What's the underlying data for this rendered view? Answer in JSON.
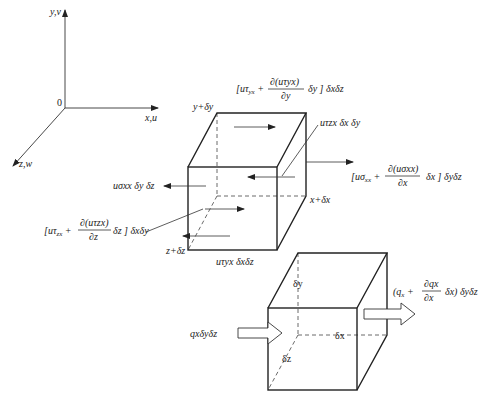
{
  "axes": {
    "y_label": "y,v",
    "x_label": "x,u",
    "z_label": "z,w",
    "origin_label": "0"
  },
  "stress_cube": {
    "top_label": "y+δy",
    "right_label": "x+δx",
    "front_label": "z+δz",
    "top_term": {
      "prefix": "[uτ",
      "sub": "yx",
      "plus": " + ",
      "num": "∂(uτyx)",
      "den": "∂y",
      "suffix": "δy ] δxδz"
    },
    "right_term": {
      "prefix": "[uσ",
      "sub": "xx",
      "plus": " + ",
      "num": "∂(uσxx)",
      "den": "∂x",
      "suffix": "δx ] δyδz"
    },
    "front_term": {
      "prefix": "[uτ",
      "sub": "zx",
      "plus": " + ",
      "num": "∂(uτzx)",
      "den": "∂z",
      "suffix": "δz ] δxδy"
    },
    "left_term": "uσxx δy δz",
    "back_term": "uτzx δx δy",
    "bottom_term": "uτyx δxδz"
  },
  "heat_cube": {
    "dy_label": "δy",
    "dx_label": "δx",
    "dz_label": "δz",
    "in_flux": "qxδyδz",
    "out_flux": {
      "open": "(q",
      "sub": "x",
      "plus": " + ",
      "num": "∂qx",
      "den": "∂x",
      "suffix": "δx)  δyδz"
    }
  },
  "colors": {
    "line": "#222222",
    "background": "#ffffff"
  }
}
